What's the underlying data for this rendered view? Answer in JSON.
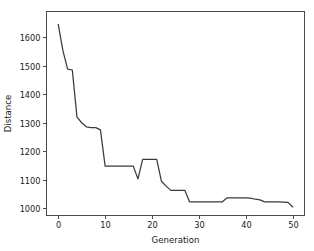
{
  "chart_data": {
    "type": "line",
    "title": "",
    "xlabel": "Generation",
    "ylabel": "Distance",
    "xlim": [
      -2.5,
      52.5
    ],
    "ylim": [
      975,
      1690
    ],
    "grid": false,
    "legend": null,
    "xticks": [
      0,
      10,
      20,
      30,
      40,
      50
    ],
    "xtick_labels": [
      "0",
      "10",
      "20",
      "30",
      "40",
      "50"
    ],
    "yticks": [
      1000,
      1100,
      1200,
      1300,
      1400,
      1500,
      1600
    ],
    "ytick_labels": [
      "1000",
      "1100",
      "1200",
      "1300",
      "1400",
      "1500",
      "1600"
    ],
    "line_color": "#3b3b3b",
    "x": [
      0,
      1,
      2,
      3,
      4,
      5,
      6,
      7,
      8,
      9,
      10,
      11,
      12,
      13,
      14,
      15,
      16,
      17,
      18,
      19,
      20,
      21,
      22,
      23,
      24,
      25,
      26,
      27,
      28,
      29,
      30,
      31,
      32,
      33,
      34,
      35,
      36,
      37,
      38,
      39,
      40,
      41,
      42,
      43,
      44,
      45,
      46,
      47,
      48,
      49,
      50
    ],
    "values": [
      1645,
      1553,
      1488,
      1485,
      1320,
      1300,
      1286,
      1283,
      1283,
      1275,
      1148,
      1148,
      1148,
      1148,
      1148,
      1148,
      1148,
      1103,
      1172,
      1172,
      1172,
      1172,
      1095,
      1078,
      1063,
      1063,
      1063,
      1063,
      1023,
      1023,
      1023,
      1023,
      1023,
      1023,
      1023,
      1023,
      1037,
      1037,
      1037,
      1037,
      1037,
      1036,
      1032,
      1030,
      1023,
      1023,
      1023,
      1023,
      1022,
      1021,
      1005
    ],
    "series_name": "Distance"
  },
  "axes": {
    "xlabel": "Generation",
    "ylabel": "Distance"
  }
}
